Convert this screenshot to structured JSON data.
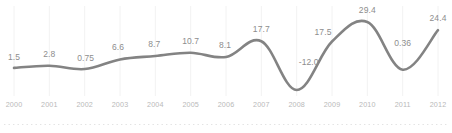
{
  "chart_data": {
    "type": "line",
    "title": "",
    "subtitle": "",
    "xlabel": "",
    "ylabel": "",
    "categories": [
      "2000",
      "2001",
      "2002",
      "2003",
      "2004",
      "2005",
      "2006",
      "2007",
      "2008",
      "2009",
      "2010",
      "2011",
      "2012"
    ],
    "values": [
      1.5,
      2.8,
      0.75,
      6.6,
      8.7,
      10.7,
      8.1,
      17.7,
      -12.0,
      17.5,
      29.4,
      0.36,
      24.4
    ],
    "point_labels": [
      "1.5",
      "2.8",
      "0.75",
      "6.6",
      "8.7",
      "10.7",
      "8.1",
      "17.7",
      "-12.0",
      "17.5",
      "29.4",
      "0.36",
      "24.4"
    ],
    "series": [
      {
        "name": "",
        "values": [
          1.5,
          2.8,
          0.75,
          6.6,
          8.7,
          10.7,
          8.1,
          17.7,
          -12.0,
          17.5,
          29.4,
          0.36,
          24.4
        ]
      }
    ],
    "ylim": [
      -15.5,
      32.5
    ],
    "xlim": [
      "2000",
      "2012"
    ],
    "grid": {
      "vertical": true,
      "horizontal": false
    },
    "legend": {
      "visible": false,
      "position": "none"
    },
    "markers": false,
    "data_labels_visible": true,
    "colors": {
      "line": "#838383",
      "gridline": "#f2f2f2",
      "value_label": "#8d8d8d",
      "tick_label": "#b9b9b9",
      "separator": "#e3e3e3",
      "background": "#ffffff"
    }
  },
  "footer": {
    "separator_visible": true
  }
}
